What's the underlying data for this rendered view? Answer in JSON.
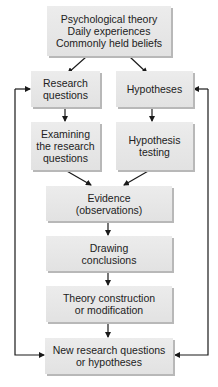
{
  "diagram": {
    "nodes": [
      {
        "id": "sources",
        "label": "Psychological theory\nDaily experiences\nCommonly held beliefs"
      },
      {
        "id": "research_questions",
        "label": "Research\nquestions"
      },
      {
        "id": "hypotheses",
        "label": "Hypotheses"
      },
      {
        "id": "examining",
        "label": "Examining\nthe research\nquestions"
      },
      {
        "id": "hypothesis_testing",
        "label": "Hypothesis\ntesting"
      },
      {
        "id": "evidence",
        "label": "Evidence\n(observations)"
      },
      {
        "id": "drawing_conclusions",
        "label": "Drawing\nconclusions"
      },
      {
        "id": "theory_construction",
        "label": "Theory construction\nor modification"
      },
      {
        "id": "new_questions",
        "label": "New research questions\nor hypotheses"
      }
    ],
    "edges": [
      {
        "from": "sources",
        "to": "research_questions"
      },
      {
        "from": "sources",
        "to": "hypotheses"
      },
      {
        "from": "research_questions",
        "to": "examining"
      },
      {
        "from": "hypotheses",
        "to": "hypothesis_testing"
      },
      {
        "from": "examining",
        "to": "evidence"
      },
      {
        "from": "hypothesis_testing",
        "to": "evidence"
      },
      {
        "from": "evidence",
        "to": "drawing_conclusions"
      },
      {
        "from": "drawing_conclusions",
        "to": "theory_construction"
      },
      {
        "from": "theory_construction",
        "to": "new_questions"
      },
      {
        "from": "new_questions",
        "to": "research_questions",
        "type": "feedback-left"
      },
      {
        "from": "new_questions",
        "to": "hypotheses",
        "type": "feedback-right"
      }
    ],
    "colors": {
      "box_fill": "#e6e6e6",
      "box_shadow": "#b8b8b8",
      "line": "#1a1a1a",
      "text": "#222222"
    }
  }
}
